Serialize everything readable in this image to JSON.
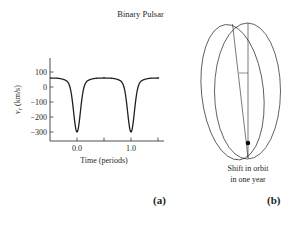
{
  "figure": {
    "title": "Binary Pulsar",
    "panel_a_label": "(a)",
    "panel_b_label": "(b)",
    "caption_b_line1": "Shift in orbit",
    "caption_b_line2": "in one year"
  },
  "chart_data": [
    {
      "type": "line",
      "title": "Binary Pulsar",
      "xlabel": "Time (periods)",
      "ylabel": "v_r (km/s)",
      "xlim": [
        -0.5,
        1.55
      ],
      "ylim": [
        -350,
        190
      ],
      "xticks": [
        0.0,
        0.5,
        1.0,
        1.5
      ],
      "xtick_labels": [
        "0.0",
        "",
        "1.0",
        ""
      ],
      "yticks": [
        100,
        0,
        -100,
        -200,
        -300
      ],
      "ytick_labels": [
        "100",
        "0",
        "−100",
        "−200",
        "−300"
      ],
      "grid": false,
      "series": [
        {
          "name": "radial velocity",
          "x": [
            -0.5,
            -0.4,
            -0.3,
            -0.2,
            -0.15,
            -0.1,
            -0.05,
            0.0,
            0.05,
            0.1,
            0.15,
            0.2,
            0.3,
            0.4,
            0.5,
            0.6,
            0.7,
            0.8,
            0.85,
            0.9,
            0.95,
            1.0,
            1.05,
            1.1,
            1.15,
            1.2,
            1.3,
            1.4,
            1.5
          ],
          "y": [
            60,
            55,
            35,
            -10,
            -60,
            -150,
            -270,
            -300,
            -270,
            -150,
            -60,
            -10,
            35,
            55,
            60,
            55,
            35,
            -10,
            -60,
            -150,
            -270,
            -300,
            -270,
            -150,
            -60,
            -10,
            35,
            55,
            60
          ]
        }
      ]
    },
    {
      "type": "diagram",
      "title": "Shift in orbit in one year",
      "description": "Two overlapping elongated ellipses (orbits) sharing a common bottom focus point, with major axes slightly rotated relative to each other; a dot marks the common focus."
    }
  ]
}
